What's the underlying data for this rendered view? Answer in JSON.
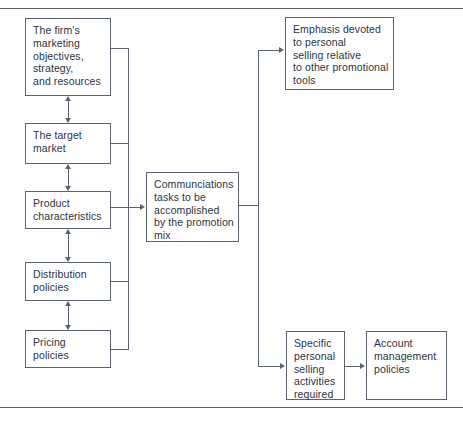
{
  "diagram": {
    "line_color": "#5a6470",
    "background": "#fdfdfd",
    "nodes": [
      {
        "id": "firm-objectives",
        "text": "The firm's\nmarketing\nobjectives,\nstrategy,\nand resources"
      },
      {
        "id": "target-market",
        "text": "The target\nmarket"
      },
      {
        "id": "product-characteristics",
        "text": "Product\ncharacteristics"
      },
      {
        "id": "distribution-policies",
        "text": "Distribution\npolicies"
      },
      {
        "id": "pricing-policies",
        "text": "Pricing\npolicies"
      },
      {
        "id": "communications-tasks",
        "text": "Communciations\ntasks to be\naccomplished\nby the promotion\nmix"
      },
      {
        "id": "emphasis-personal-selling",
        "text": "Emphasis devoted\nto personal\nselling relative\nto other promotional\ntools"
      },
      {
        "id": "specific-selling-activities",
        "text": "Specific\npersonal\nselling\nactivities\nrequired"
      },
      {
        "id": "account-management",
        "text": "Account\nmanagement\npolicies"
      }
    ]
  }
}
